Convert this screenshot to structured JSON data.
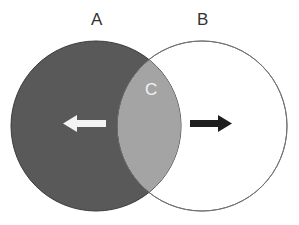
{
  "diagram": {
    "type": "venn",
    "sets": [
      {
        "label": "A",
        "fill": "#595959",
        "stroke": "#3a3a3a"
      },
      {
        "label": "B",
        "fill": "#ffffff",
        "stroke": "#707070"
      }
    ],
    "intersection": {
      "label": "C",
      "fill": "#a4a4a4",
      "label_color": "#f2f2f2"
    },
    "arrows": [
      {
        "name": "left-arrow",
        "direction": "left",
        "color": "#f4f4f4",
        "in_set": "A"
      },
      {
        "name": "right-arrow",
        "direction": "right",
        "color": "#1e1e1e",
        "in_set": "B"
      }
    ]
  }
}
